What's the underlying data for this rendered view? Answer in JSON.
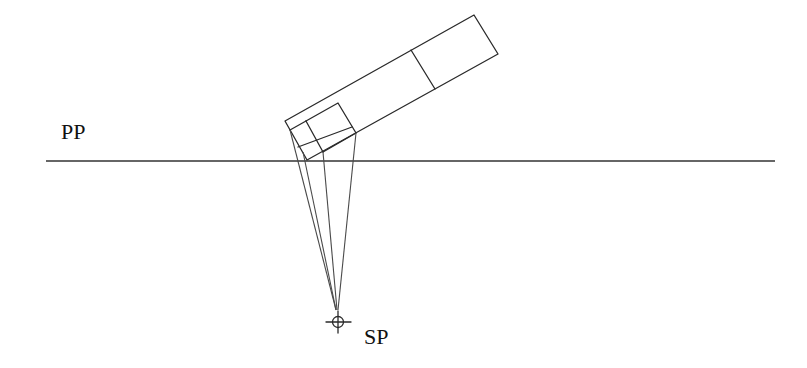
{
  "diagram": {
    "labels": {
      "picture_plane": "PP",
      "station_point": "SP"
    },
    "colors": {
      "background": "#ffffff",
      "line": "#2a2a2a"
    },
    "picture_plane": {
      "y": 161,
      "x_start": 46,
      "x_end": 775
    },
    "station_point": {
      "x": 338,
      "y": 322,
      "marker": "crosshair-circle"
    },
    "object": {
      "outer_rectangle": [
        [
          285,
          121
        ],
        [
          474,
          15
        ],
        [
          498,
          54
        ],
        [
          307,
          160
        ]
      ],
      "divider": [
        [
          411,
          50
        ],
        [
          435,
          89
        ]
      ],
      "small_box": [
        [
          306,
          121
        ],
        [
          338,
          103
        ],
        [
          356,
          133
        ],
        [
          323,
          152
        ]
      ]
    },
    "projectors": [
      {
        "from": [
          291,
          130
        ],
        "to": [
          336,
          310
        ]
      },
      {
        "from": [
          307,
          160
        ],
        "to": [
          336,
          310
        ]
      },
      {
        "from": [
          323,
          152
        ],
        "to": [
          337,
          310
        ]
      },
      {
        "from": [
          356,
          133
        ],
        "to": [
          338,
          310
        ]
      }
    ]
  }
}
